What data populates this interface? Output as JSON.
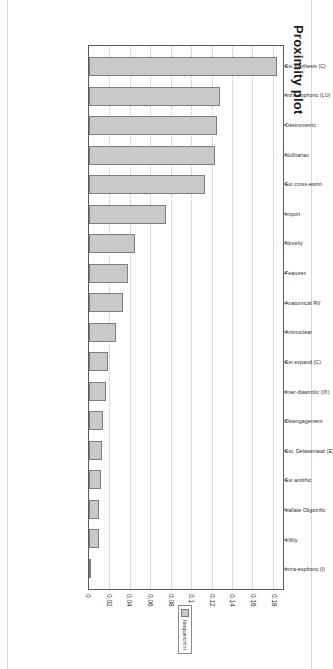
{
  "figure": {
    "title": "Proximity plot"
  },
  "legend": {
    "swatch_name": "series-swatch",
    "label": "Isoquercitrin",
    "color": "#c9c9c9"
  },
  "chart_data": {
    "type": "bar",
    "title": "Proximity plot",
    "xlabel": "",
    "ylabel": "",
    "orientation": "vertical",
    "grid": true,
    "legend_position": "right",
    "value_axis_range": [
      0,
      0.19
    ],
    "value_ticks": [
      "0",
      "0.02",
      "0.04",
      "0.06",
      "0.08",
      "0.1",
      "0.12",
      "0.14",
      "0.16",
      "0.18"
    ],
    "value_tick_numbers": [
      0,
      0.02,
      0.04,
      0.06,
      0.08,
      0.1,
      0.12,
      0.14,
      0.16,
      0.18
    ],
    "categories": [
      "Est synthesis (C)",
      "Intra-oophoric (LU)",
      "Oestrometric",
      "Nullitarian",
      "Est cross-estrin",
      "Import",
      "Novelty",
      "Featurex",
      "Anatomical RV",
      "Antinuclear",
      "Est expand (C)",
      "Inter-diastrolic (IX)",
      "Disengagement",
      "Est. Delaserratal (E)",
      "Est antithic",
      "Vallate Oligotrific",
      "Villity",
      "Intra-eophoric (I)"
    ],
    "values": [
      0.1845,
      0.1285,
      0.1255,
      0.1235,
      0.114,
      0.0758,
      0.0455,
      0.038,
      0.033,
      0.0262,
      0.019,
      0.0165,
      0.0133,
      0.013,
      0.0113,
      0.0096,
      0.0095,
      0.002
    ],
    "series": [
      {
        "name": "Isoquercitrin",
        "color": "#c9c9c9",
        "values": [
          0.1845,
          0.1285,
          0.1255,
          0.1235,
          0.114,
          0.0758,
          0.0455,
          0.038,
          0.033,
          0.0262,
          0.019,
          0.0165,
          0.0133,
          0.013,
          0.0113,
          0.0096,
          0.0095,
          0.002
        ]
      }
    ]
  }
}
